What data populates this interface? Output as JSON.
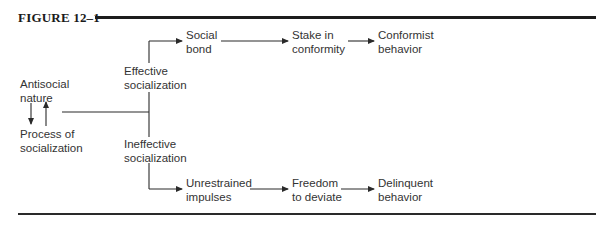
{
  "figure": {
    "label": "FIGURE 12–1"
  },
  "nodes": {
    "antisocial_nature": {
      "line1": "Antisocial",
      "line2": "nature"
    },
    "process_of_socialization": {
      "line1": "Process of",
      "line2": "socialization"
    },
    "effective_socialization": {
      "line1": "Effective",
      "line2": "socialization"
    },
    "ineffective_socialization": {
      "line1": "Ineffective",
      "line2": "socialization"
    },
    "social_bond": {
      "line1": "Social",
      "line2": "bond"
    },
    "stake_in_conformity": {
      "line1": "Stake in",
      "line2": "conformity"
    },
    "conformist_behavior": {
      "line1": "Conformist",
      "line2": "behavior"
    },
    "unrestrained_impulses": {
      "line1": "Unrestrained",
      "line2": "impulses"
    },
    "freedom_to_deviate": {
      "line1": "Freedom",
      "line2": "to deviate"
    },
    "delinquent_behavior": {
      "line1": "Delinquent",
      "line2": "behavior"
    }
  },
  "edges": [
    {
      "from": "antisocial_nature",
      "to": "process_of_socialization"
    },
    {
      "from": "process_of_socialization",
      "to": "antisocial_nature"
    },
    {
      "from": "process_of_socialization",
      "to": "effective_socialization"
    },
    {
      "from": "process_of_socialization",
      "to": "ineffective_socialization"
    },
    {
      "from": "effective_socialization",
      "to": "social_bond"
    },
    {
      "from": "social_bond",
      "to": "stake_in_conformity"
    },
    {
      "from": "stake_in_conformity",
      "to": "conformist_behavior"
    },
    {
      "from": "ineffective_socialization",
      "to": "unrestrained_impulses"
    },
    {
      "from": "unrestrained_impulses",
      "to": "freedom_to_deviate"
    },
    {
      "from": "freedom_to_deviate",
      "to": "delinquent_behavior"
    }
  ],
  "colors": {
    "ink": "#2a2a2a",
    "rule": "#1c1c1c",
    "background": "#ffffff"
  }
}
